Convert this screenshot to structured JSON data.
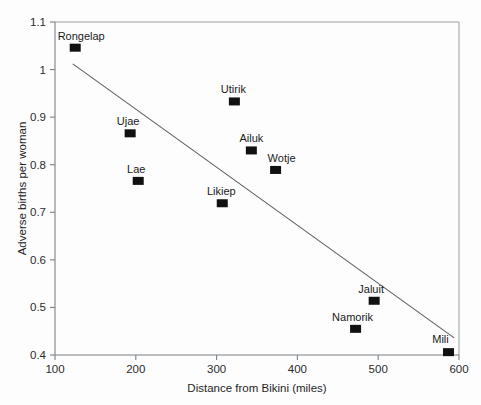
{
  "chart_data": {
    "type": "scatter",
    "title": "",
    "subtitle": "",
    "xlabel": "Distance from Bikini (miles)",
    "ylabel": "Adverse births per woman",
    "xlim": [
      100,
      600
    ],
    "ylim": [
      0.4,
      1.1
    ],
    "xticks": [
      100,
      200,
      300,
      400,
      500,
      600
    ],
    "xtick_labels": [
      "100",
      "200",
      "300",
      "400",
      "500",
      "600"
    ],
    "yticks": [
      0.4,
      0.5,
      0.6,
      0.7,
      0.8,
      0.9,
      1.0,
      1.1
    ],
    "ytick_labels": [
      "0.4",
      "0.5",
      "0.6",
      "0.7",
      "0.8",
      "0.9",
      "1",
      "1.1"
    ],
    "grid": false,
    "legend": false,
    "legend_position": "none",
    "marker_shape": "square",
    "marker_color": "#111111",
    "points": [
      {
        "label": "Rongelap",
        "x": 125,
        "y": 1.046,
        "label_dx": 6,
        "label_dy": -8
      },
      {
        "label": "Ujae",
        "x": 193,
        "y": 0.866,
        "label_dx": -2,
        "label_dy": -8
      },
      {
        "label": "Lae",
        "x": 203,
        "y": 0.766,
        "label_dx": -2,
        "label_dy": -8
      },
      {
        "label": "Likiep",
        "x": 307,
        "y": 0.719,
        "label_dx": -1,
        "label_dy": -8
      },
      {
        "label": "Utirik",
        "x": 322,
        "y": 0.933,
        "label_dx": -1,
        "label_dy": -8
      },
      {
        "label": "Ailuk",
        "x": 343,
        "y": 0.83,
        "label_dx": 0,
        "label_dy": -8
      },
      {
        "label": "Wotje",
        "x": 373,
        "y": 0.789,
        "label_dx": 6,
        "label_dy": -8
      },
      {
        "label": "Namorik",
        "x": 472,
        "y": 0.455,
        "label_dx": -3,
        "label_dy": -8
      },
      {
        "label": "Jaluit",
        "x": 495,
        "y": 0.514,
        "label_dx": -3,
        "label_dy": -8
      },
      {
        "label": "Mili",
        "x": 587,
        "y": 0.406,
        "label_dx": -8,
        "label_dy": -9
      }
    ],
    "trend_line": {
      "type": "line",
      "color": "#5e6366",
      "x": [
        122,
        594
      ],
      "y": [
        1.012,
        0.436
      ]
    }
  }
}
